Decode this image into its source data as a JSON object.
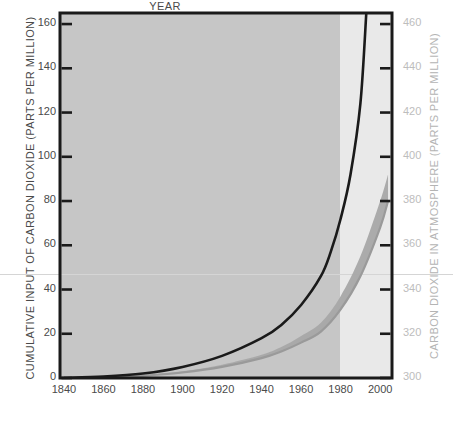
{
  "chart_data": {
    "type": "line",
    "title": "",
    "xlabel": "YEAR",
    "ylabel": "CUMULATIVE INPUT OF CARBON DIOXIDE (PARTS PER MILLION)",
    "ylabel_right": "CARBON DIOXIDE IN ATMOSPHERE (PARTS PER MILLION)",
    "xlim": [
      1838,
      2006
    ],
    "ylim": [
      0,
      165
    ],
    "ylim_right": [
      300,
      465
    ],
    "grid": false,
    "legend": false,
    "xticks": [
      1840,
      1860,
      1880,
      1900,
      1920,
      1940,
      1960,
      1980,
      2000
    ],
    "yticks": [
      0,
      20,
      40,
      60,
      80,
      100,
      120,
      140,
      160
    ],
    "yticks_right": [
      300,
      320,
      340,
      360,
      380,
      400,
      420,
      440,
      460
    ],
    "shaded_regions": [
      {
        "name": "historical-region",
        "x_start": 1838,
        "x_end": 1970,
        "color": "#c6c6c6"
      },
      {
        "name": "projection-region",
        "x_start": 1970,
        "x_end": 2006,
        "color": "#e9e9e9"
      }
    ],
    "series": [
      {
        "name": "Cumulative input of carbon dioxide",
        "color": "#1a1a1a",
        "x": [
          1840,
          1860,
          1880,
          1900,
          1920,
          1940,
          1950,
          1960,
          1970,
          1975,
          1980,
          1985,
          1990,
          1993
        ],
        "values": [
          0,
          0.6,
          2,
          5,
          10,
          18,
          24,
          33,
          46,
          57,
          72,
          92,
          124,
          165
        ]
      },
      {
        "name": "Carbon dioxide in atmosphere",
        "color": "#9a9a9a",
        "x": [
          1840,
          1860,
          1880,
          1900,
          1920,
          1940,
          1950,
          1960,
          1970,
          1980,
          1990,
          2000,
          2004
        ],
        "values": [
          0,
          0.3,
          1,
          2.5,
          5,
          9,
          12,
          16,
          21,
          31,
          46,
          68,
          80
        ],
        "band": {
          "name": "atmosphere-uncertainty-band",
          "color": "#a8a8a8",
          "upper": [
            0,
            0.4,
            1.2,
            3,
            6,
            10.5,
            14,
            19,
            25,
            37,
            55,
            80,
            92
          ],
          "lower": [
            0,
            0.3,
            1,
            2.5,
            5,
            9,
            12,
            16,
            21,
            31,
            46,
            68,
            80
          ]
        }
      }
    ]
  },
  "axes": {
    "left_title": "CUMULATIVE INPUT OF CARBON DIOXIDE (PARTS PER MILLION)",
    "right_title": "CARBON DIOXIDE IN ATMOSPHERE (PARTS PER MILLION)",
    "x_title": "YEAR",
    "left_ticks": [
      "160",
      "140",
      "120",
      "100",
      "80",
      "60",
      "40",
      "20",
      "0"
    ],
    "right_ticks": [
      "460",
      "440",
      "420",
      "400",
      "380",
      "360",
      "340",
      "320",
      "300"
    ],
    "x_ticks": [
      "1840",
      "1860",
      "1880",
      "1900",
      "1920",
      "1940",
      "1960",
      "1980",
      "2000"
    ]
  },
  "colors": {
    "frame": "#1a1a1a",
    "historical_bg": "#c6c6c6",
    "projection_bg": "#e9e9e9",
    "curve_primary": "#1a1a1a",
    "curve_secondary": "#9a9a9a",
    "band": "#a8a8a8",
    "tick_left": "#4a4a4a",
    "tick_right": "#bdbdbd"
  }
}
